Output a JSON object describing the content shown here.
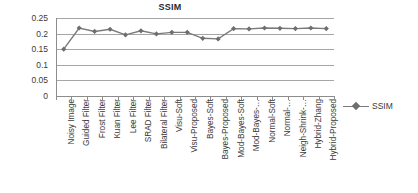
{
  "chart_data": {
    "type": "line",
    "title": "SSIM",
    "xlabel": "",
    "ylabel": "",
    "ylim": [
      0,
      0.25
    ],
    "yticks": [
      "0",
      "0.05",
      "0.1",
      "0.15",
      "0.2",
      "0.25"
    ],
    "ytick_values": [
      0,
      0.05,
      0.1,
      0.15,
      0.2,
      0.25
    ],
    "grid": true,
    "legend_position": "right",
    "legend": [
      "SSIM"
    ],
    "marker": "diamond",
    "line_color": "#7a7a7a",
    "marker_color": "#6e6e6e",
    "categories": [
      "Noisy Image",
      "Guided Filter",
      "Frost Filter",
      "Kuan Filter",
      "Lee Filter",
      "SRAD Filter",
      "Bilateral Filter",
      "Visu-Soft",
      "Visu-Proposed",
      "Bayes-Soft",
      "Bayes-Proposed",
      "Mod-Bayes-Soft",
      "Mod-Bayes-…",
      "Normal-Soft",
      "Normal-…",
      "Neigh-Shrink-…",
      "Hybrid-Zhang",
      "Hybrid-Proposed"
    ],
    "series": [
      {
        "name": "SSIM",
        "values": [
          0.15,
          0.218,
          0.207,
          0.214,
          0.196,
          0.209,
          0.199,
          0.204,
          0.204,
          0.185,
          0.183,
          0.216,
          0.215,
          0.218,
          0.217,
          0.216,
          0.218,
          0.216
        ]
      }
    ]
  },
  "legend": {
    "entries": [
      {
        "label": "SSIM"
      }
    ]
  }
}
